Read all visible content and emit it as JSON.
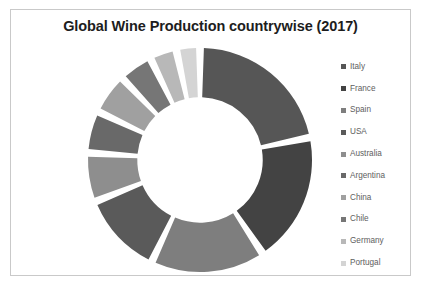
{
  "chart_data": {
    "type": "pie",
    "variant": "doughnut",
    "title": "Global Wine Production countrywise (2017)",
    "xlabel": "",
    "ylabel": "",
    "legend_position": "right",
    "grid": false,
    "start_angle_deg": 0,
    "direction": "clockwise",
    "inner_radius_ratio": 0.56,
    "gap_deg": 4,
    "categories": [
      "Italy",
      "France",
      "Spain",
      "USA",
      "Australia",
      "Argentina",
      "China",
      "Chile",
      "Germany",
      "Portugal"
    ],
    "values": [
      42.5,
      36.7,
      32.1,
      23.3,
      13.7,
      11.8,
      11.4,
      9.5,
      7.5,
      6.6
    ],
    "unit": "million hectolitres",
    "colors": [
      "#565656",
      "#434343",
      "#7e7e7e",
      "#5a5a5a",
      "#8e8e8e",
      "#696969",
      "#a0a0a0",
      "#767676",
      "#b8b8b8",
      "#d4d4d4"
    ],
    "series": [
      {
        "name": "Production 2017",
        "values": [
          42.5,
          36.7,
          32.1,
          23.3,
          13.7,
          11.8,
          11.4,
          9.5,
          7.5,
          6.6
        ]
      }
    ],
    "slices": [
      {
        "label": "Italy",
        "value": 42.5,
        "color": "#565656"
      },
      {
        "label": "France",
        "value": 36.7,
        "color": "#434343"
      },
      {
        "label": "Spain",
        "value": 32.1,
        "color": "#7e7e7e"
      },
      {
        "label": "USA",
        "value": 23.3,
        "color": "#5a5a5a"
      },
      {
        "label": "Australia",
        "value": 13.7,
        "color": "#8e8e8e"
      },
      {
        "label": "Argentina",
        "value": 11.8,
        "color": "#696969"
      },
      {
        "label": "China",
        "value": 11.4,
        "color": "#a0a0a0"
      },
      {
        "label": "Chile",
        "value": 9.5,
        "color": "#767676"
      },
      {
        "label": "Germany",
        "value": 7.5,
        "color": "#b8b8b8"
      },
      {
        "label": "Portugal",
        "value": 6.6,
        "color": "#d4d4d4"
      }
    ]
  },
  "legend": {
    "items": [
      {
        "label": "Italy",
        "color": "#565656"
      },
      {
        "label": "France",
        "color": "#434343"
      },
      {
        "label": "Spain",
        "color": "#7e7e7e"
      },
      {
        "label": "USA",
        "color": "#5a5a5a"
      },
      {
        "label": "Australia",
        "color": "#8e8e8e"
      },
      {
        "label": "Argentina",
        "color": "#696969"
      },
      {
        "label": "China",
        "color": "#a0a0a0"
      },
      {
        "label": "Chile",
        "color": "#767676"
      },
      {
        "label": "Germany",
        "color": "#b8b8b8"
      },
      {
        "label": "Portugal",
        "color": "#d4d4d4"
      }
    ]
  }
}
